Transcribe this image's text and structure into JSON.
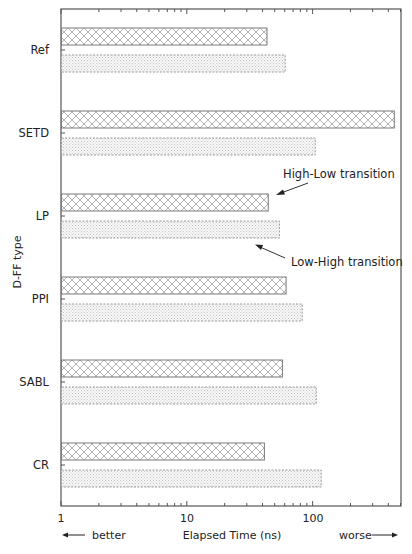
{
  "chart_data": {
    "type": "bar",
    "orientation": "horizontal",
    "title": "",
    "xlabel": "Elapsed Time (ns)",
    "ylabel": "D-FF type",
    "xscale": "log",
    "xlim": [
      1,
      500
    ],
    "x_ticks": [
      1,
      10,
      100
    ],
    "x_tick_labels": [
      "1",
      "10",
      "100"
    ],
    "grid": false,
    "categories": [
      "Ref",
      "SETD",
      "LP",
      "PPI",
      "SABL",
      "CR"
    ],
    "series": [
      {
        "name": "High-Low transition",
        "pattern": "crosshatch",
        "border": "solid",
        "values": [
          43,
          442,
          44,
          61,
          57,
          41
        ]
      },
      {
        "name": "Low-High transition",
        "pattern": "dots",
        "border": "dashed",
        "values": [
          60,
          104,
          54,
          82,
          106,
          116
        ]
      }
    ],
    "annotations": [
      {
        "text": "High-Low transition",
        "points_to": "LP High-Low bar"
      },
      {
        "text": "Low-High transition",
        "points_to": "LP Low-High bar"
      },
      {
        "text": "better",
        "position": "bottom-left",
        "arrow": "left"
      },
      {
        "text": "worse",
        "position": "bottom-right",
        "arrow": "right"
      }
    ],
    "legend": "none (inline annotations)"
  },
  "labels": {
    "xlabel": "Elapsed Time (ns)",
    "ylabel": "D-FF type",
    "better": "better",
    "worse": "worse",
    "annot_hl": "High-Low transition",
    "annot_lh": "Low-High transition",
    "tick_1": "1",
    "tick_10": "10",
    "tick_100": "100",
    "cat_0": "Ref",
    "cat_1": "SETD",
    "cat_2": "LP",
    "cat_3": "PPI",
    "cat_4": "SABL",
    "cat_5": "CR"
  },
  "colors": {
    "axis": "#555555",
    "bar_border": "#777777",
    "hatch": "#9a9a9a",
    "dots": "#b5b5b5"
  }
}
